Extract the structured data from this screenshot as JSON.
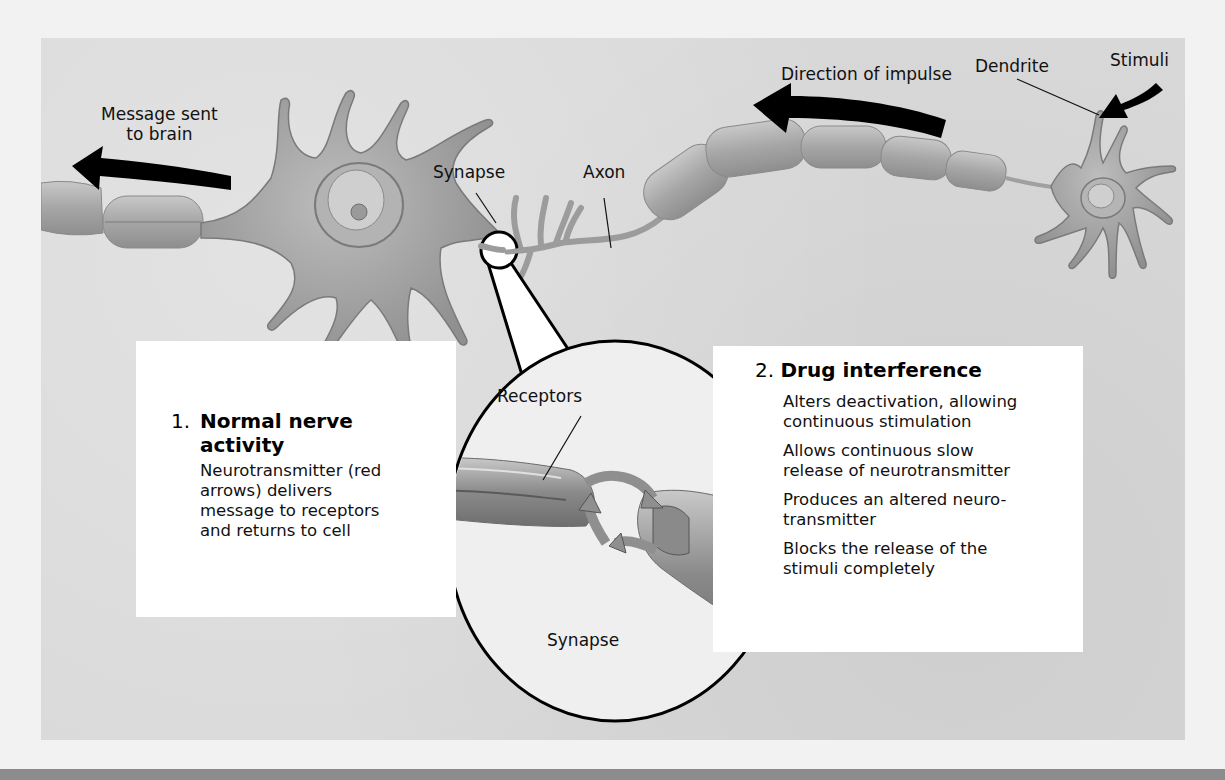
{
  "diagram": {
    "labels": {
      "message_sent": [
        "Message sent",
        "to brain"
      ],
      "direction_of_impulse": "Direction of impulse",
      "dendrite": "Dendrite",
      "stimuli": "Stimuli",
      "synapse_top": "Synapse",
      "axon": "Axon",
      "receptors": "Receptors",
      "synapse_inset": "Synapse"
    },
    "arrows": [
      {
        "name": "message-to-brain-arrow",
        "direction": "left"
      },
      {
        "name": "direction-of-impulse-arrow",
        "direction": "left"
      },
      {
        "name": "stimuli-arrow",
        "direction": "down-left"
      }
    ],
    "box_normal": {
      "number": "1.",
      "title_lines": [
        "Normal nerve",
        "activity"
      ],
      "body_lines": [
        "Neurotransmitter (red",
        "arrows) delivers",
        "message to receptors",
        "and returns to cell"
      ]
    },
    "box_drug": {
      "number": "2.",
      "title": "Drug interference",
      "items": [
        [
          "Alters deactivation, allowing",
          "continuous stimulation"
        ],
        [
          "Allows continuous slow",
          "release of neurotransmitter"
        ],
        [
          "Produces an altered neuro-",
          "transmitter"
        ],
        [
          "Blocks the release of the",
          "stimuli completely"
        ]
      ]
    },
    "colors": {
      "background": "#d9d9d9",
      "neuron": "#a9a9a9",
      "arrow": "#000000",
      "box": "#ffffff"
    }
  }
}
